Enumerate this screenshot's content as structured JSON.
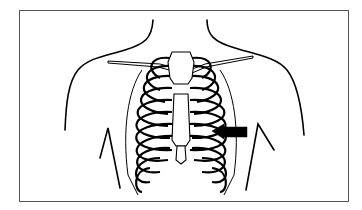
{
  "figure": {
    "view": "anterior",
    "elements": [
      "torso-outline",
      "clavicles",
      "sternum",
      "ribs",
      "arms-outline",
      "indicator-arrow"
    ],
    "indicator": {
      "shape": "arrow",
      "direction": "left",
      "color": "#000000",
      "points_to": "lower-left-rib-region"
    },
    "colors": {
      "line": "#000000",
      "background": "#ffffff",
      "frame": "#555555"
    }
  }
}
